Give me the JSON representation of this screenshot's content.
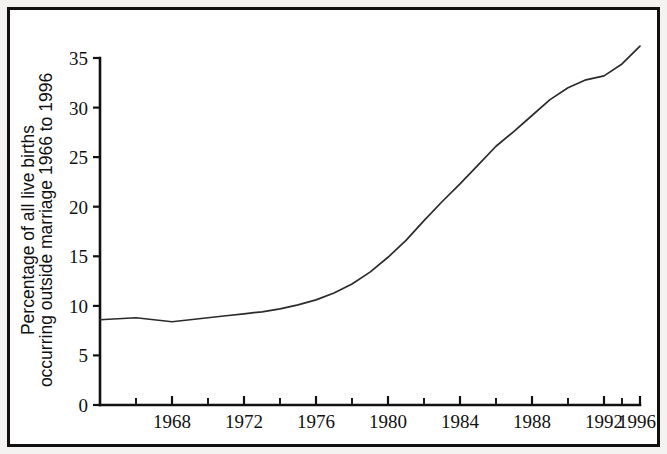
{
  "figure": {
    "border_color": "#111111",
    "background_color": "#ffffff",
    "line_color": "#2b2b2b"
  },
  "axis": {
    "y_title_line1": "Percentage of all live births",
    "y_title_line2": "occurring outside marriage 1966 to 1996",
    "y_ticks": [
      "0",
      "5",
      "10",
      "15",
      "20",
      "25",
      "30",
      "35"
    ],
    "x_ticks": [
      "1968",
      "1972",
      "1976",
      "1980",
      "1984",
      "1988",
      "1992",
      "1996"
    ]
  },
  "chart_data": {
    "type": "line",
    "title": "",
    "subtitle": "",
    "xlabel": "",
    "ylabel": "Percentage of all live births occurring outside marriage 1966 to 1996",
    "xlim": [
      1966,
      1996
    ],
    "ylim": [
      0,
      35
    ],
    "x_tick_values": [
      1968,
      1972,
      1976,
      1980,
      1984,
      1988,
      1992,
      1996
    ],
    "x_minor_tick_interval": 2,
    "y_tick_values": [
      0,
      5,
      10,
      15,
      20,
      25,
      30,
      35
    ],
    "grid": false,
    "legend": null,
    "series": [
      {
        "name": "Percentage of live births outside marriage",
        "x": [
          1966,
          1967,
          1968,
          1969,
          1970,
          1971,
          1972,
          1973,
          1974,
          1975,
          1976,
          1977,
          1978,
          1979,
          1980,
          1981,
          1982,
          1983,
          1984,
          1985,
          1986,
          1987,
          1988,
          1989,
          1990,
          1991,
          1992,
          1993,
          1994,
          1995,
          1996
        ],
        "values": [
          8.6,
          8.7,
          8.8,
          8.6,
          8.4,
          8.6,
          8.8,
          9.0,
          9.2,
          9.4,
          9.7,
          10.1,
          10.6,
          11.3,
          12.2,
          13.4,
          14.9,
          16.6,
          18.6,
          20.5,
          22.3,
          24.2,
          26.1,
          27.6,
          29.2,
          30.8,
          32.0,
          32.8,
          33.2,
          34.4,
          36.2
        ]
      }
    ]
  }
}
